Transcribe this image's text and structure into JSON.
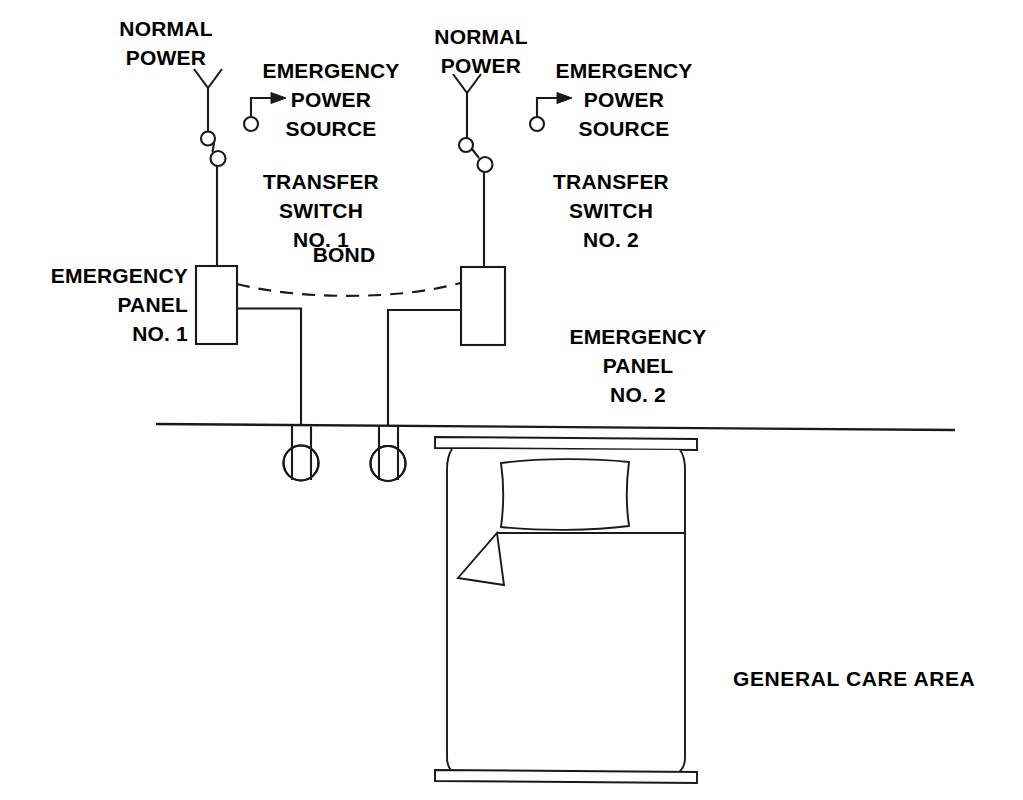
{
  "diagram": {
    "title_text": "",
    "ink_color": "#1a1a1a",
    "background_color": "#ffffff"
  },
  "labels": {
    "normal_power_1": "NORMAL\nPOWER",
    "emergency_power_source_1": "EMERGENCY\nPOWER\nSOURCE",
    "transfer_switch_1": "TRANSFER\nSWITCH\nNO. 1",
    "emergency_panel_1": "EMERGENCY\nPANEL\nNO. 1",
    "bond": "BOND",
    "normal_power_2": "NORMAL\nPOWER",
    "emergency_power_source_2": "EMERGENCY\nPOWER\nSOURCE",
    "transfer_switch_2": "TRANSFER\nSWITCH\nNO. 2",
    "emergency_panel_2": "EMERGENCY\nPANEL\nNO. 2",
    "general_care_area": "GENERAL CARE AREA"
  },
  "symbols": {
    "transfer_switch_1": {
      "name": "transfer-switch-no-1",
      "normal_source_label": "NORMAL POWER",
      "emergency_source_label": "EMERGENCY POWER SOURCE",
      "pivot_open": true
    },
    "transfer_switch_2": {
      "name": "transfer-switch-no-2",
      "normal_source_label": "NORMAL POWER",
      "emergency_source_label": "EMERGENCY POWER SOURCE",
      "pivot_open": true
    },
    "emergency_panel_1": {
      "name": "emergency-panel-no-1"
    },
    "emergency_panel_2": {
      "name": "emergency-panel-no-2"
    },
    "bond_conductor": {
      "name": "bond-conductor",
      "style": "dashed-arc"
    },
    "receptacle_1": {
      "name": "receptacle-outlet-1",
      "fed_from": "EMERGENCY PANEL NO. 1"
    },
    "receptacle_2": {
      "name": "receptacle-outlet-2",
      "fed_from": "EMERGENCY PANEL NO. 2"
    },
    "wall_line": {
      "name": "wall-line"
    },
    "patient_bed": {
      "name": "patient-bed"
    }
  }
}
